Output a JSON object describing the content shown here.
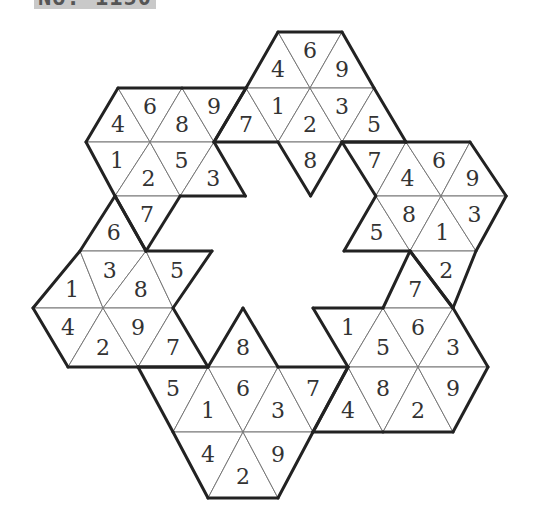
{
  "caption": "No. 1150",
  "puzzle": {
    "rows_y": [
      32,
      88,
      142,
      196,
      251,
      308,
      367,
      432,
      498
    ],
    "row_unit": [
      32,
      32,
      32,
      32.6,
      33,
      35,
      35,
      35,
      35
    ],
    "center_x": 278,
    "center_k": 8,
    "shapes": [
      {
        "name": "top",
        "cells": [
          {
            "r": 0,
            "k": 8,
            "up": true,
            "v": "4"
          },
          {
            "r": 0,
            "k": 9,
            "up": false,
            "v": "6"
          },
          {
            "r": 0,
            "k": 10,
            "up": true,
            "v": "9"
          },
          {
            "r": 1,
            "k": 7,
            "up": true,
            "v": "7"
          },
          {
            "r": 1,
            "k": 8,
            "up": false,
            "v": "1"
          },
          {
            "r": 1,
            "k": 9,
            "up": true,
            "v": "2"
          },
          {
            "r": 1,
            "k": 10,
            "up": false,
            "v": "3"
          },
          {
            "r": 1,
            "k": 11,
            "up": true,
            "v": "5"
          },
          {
            "r": 2,
            "k": 9,
            "up": false,
            "v": "8"
          }
        ]
      },
      {
        "name": "top-left",
        "cells": [
          {
            "r": 1,
            "k": 3,
            "up": true,
            "v": "4"
          },
          {
            "r": 1,
            "k": 4,
            "up": false,
            "v": "6"
          },
          {
            "r": 1,
            "k": 5,
            "up": true,
            "v": "8"
          },
          {
            "r": 1,
            "k": 6,
            "up": false,
            "v": "9"
          },
          {
            "r": 2,
            "k": 3,
            "up": false,
            "v": "1"
          },
          {
            "r": 2,
            "k": 4,
            "up": true,
            "v": "2"
          },
          {
            "r": 2,
            "k": 5,
            "up": false,
            "v": "5"
          },
          {
            "r": 2,
            "k": 6,
            "up": true,
            "v": "3"
          },
          {
            "r": 3,
            "k": 4,
            "up": false,
            "v": "7"
          }
        ]
      },
      {
        "name": "left",
        "cells": [
          {
            "r": 3,
            "k": 3,
            "up": true,
            "v": "6"
          },
          {
            "r": 4,
            "k": 2,
            "up": true,
            "v": "1"
          },
          {
            "r": 4,
            "k": 3,
            "up": false,
            "v": "3"
          },
          {
            "r": 4,
            "k": 4,
            "up": true,
            "v": "8"
          },
          {
            "r": 4,
            "k": 5,
            "up": false,
            "v": "5"
          },
          {
            "r": 5,
            "k": 2,
            "up": false,
            "v": "4"
          },
          {
            "r": 5,
            "k": 3,
            "up": true,
            "v": "2"
          },
          {
            "r": 5,
            "k": 4,
            "up": false,
            "v": "9"
          },
          {
            "r": 5,
            "k": 5,
            "up": true,
            "v": "7"
          }
        ]
      },
      {
        "name": "bottom",
        "cells": [
          {
            "r": 5,
            "k": 7,
            "up": true,
            "v": "8"
          },
          {
            "r": 6,
            "k": 5,
            "up": false,
            "v": "5"
          },
          {
            "r": 6,
            "k": 6,
            "up": true,
            "v": "1"
          },
          {
            "r": 6,
            "k": 7,
            "up": false,
            "v": "6"
          },
          {
            "r": 6,
            "k": 8,
            "up": true,
            "v": "3"
          },
          {
            "r": 6,
            "k": 9,
            "up": false,
            "v": "7"
          },
          {
            "r": 7,
            "k": 6,
            "up": false,
            "v": "4"
          },
          {
            "r": 7,
            "k": 7,
            "up": true,
            "v": "2"
          },
          {
            "r": 7,
            "k": 8,
            "up": false,
            "v": "9"
          }
        ]
      },
      {
        "name": "bottom-right",
        "cells": [
          {
            "r": 4,
            "k": 12,
            "up": true,
            "v": "7"
          },
          {
            "r": 5,
            "k": 10,
            "up": false,
            "v": "1"
          },
          {
            "r": 5,
            "k": 11,
            "up": true,
            "v": "5"
          },
          {
            "r": 5,
            "k": 12,
            "up": false,
            "v": "6"
          },
          {
            "r": 5,
            "k": 13,
            "up": true,
            "v": "3"
          },
          {
            "r": 6,
            "k": 10,
            "up": true,
            "v": "4"
          },
          {
            "r": 6,
            "k": 11,
            "up": false,
            "v": "8"
          },
          {
            "r": 6,
            "k": 12,
            "up": true,
            "v": "2"
          },
          {
            "r": 6,
            "k": 13,
            "up": false,
            "v": "9"
          }
        ]
      },
      {
        "name": "right",
        "cells": [
          {
            "r": 2,
            "k": 11,
            "up": false,
            "v": "7"
          },
          {
            "r": 2,
            "k": 12,
            "up": true,
            "v": "4"
          },
          {
            "r": 2,
            "k": 13,
            "up": false,
            "v": "6"
          },
          {
            "r": 2,
            "k": 14,
            "up": true,
            "v": "9"
          },
          {
            "r": 3,
            "k": 11,
            "up": true,
            "v": "5"
          },
          {
            "r": 3,
            "k": 12,
            "up": false,
            "v": "8"
          },
          {
            "r": 3,
            "k": 13,
            "up": true,
            "v": "1"
          },
          {
            "r": 3,
            "k": 14,
            "up": false,
            "v": "3"
          },
          {
            "r": 4,
            "k": 13,
            "up": false,
            "v": "2"
          }
        ]
      }
    ]
  }
}
